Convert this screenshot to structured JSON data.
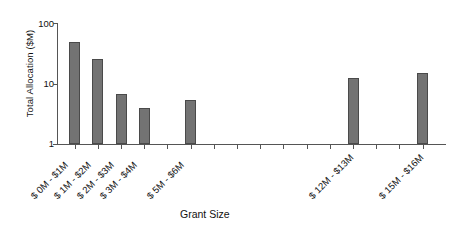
{
  "chart_data": {
    "type": "bar",
    "title": "",
    "xlabel": "Grant Size",
    "ylabel": "Total Allocation ($M)",
    "yscale": "log",
    "ylim": [
      1,
      100
    ],
    "yticks": [
      1,
      10,
      100
    ],
    "ytick_labels": [
      "1",
      "10",
      "100"
    ],
    "grid": false,
    "legend": null,
    "bar_color": "#737373",
    "bar_edge_color": "#4a4a4a",
    "categories": [
      "$ 0M - $1M",
      "$ 1M - $2M",
      "$ 2M - $3M",
      "$ 3M - $4M",
      "$ 4M - $5M",
      "$ 5M - $6M",
      "$ 6M - $7M",
      "$ 7M - $8M",
      "$ 8M - $9M",
      "$ 9M - $10M",
      "$ 10M - $11M",
      "$ 11M - $12M",
      "$ 12M - $13M",
      "$ 13M - $14M",
      "$ 14M - $15M",
      "$ 15M - $16M"
    ],
    "values": [
      48,
      25,
      6.8,
      4.0,
      0,
      5.3,
      0,
      0,
      0,
      0,
      0,
      0,
      12.5,
      0,
      0,
      15
    ],
    "visible_tick_labels": [
      "$ 0M - $1M",
      "$ 1M - $2M",
      "$ 2M - $3M",
      "$ 3M - $4M",
      "$ 5M - $6M",
      "$ 12M - $13M",
      "$ 15M - $16M"
    ]
  }
}
